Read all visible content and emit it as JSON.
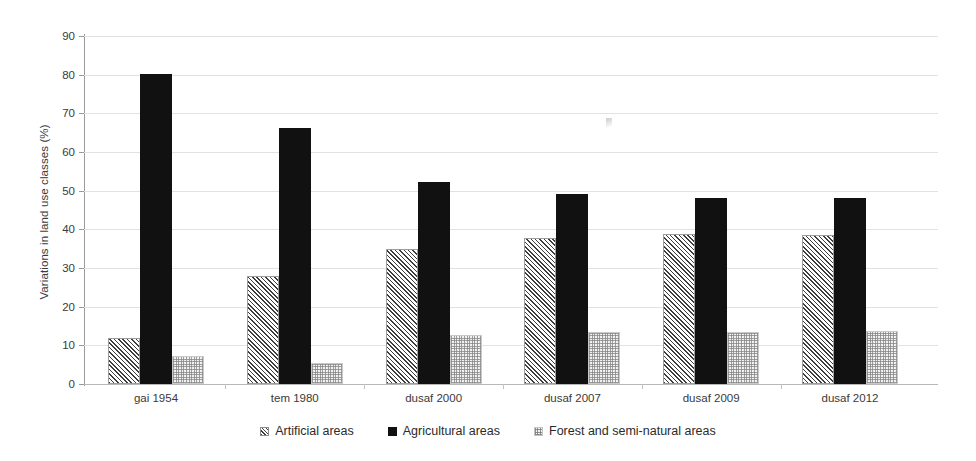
{
  "chart_data": {
    "type": "bar",
    "title": "",
    "subtitle": "",
    "xlabel": "",
    "ylabel": "Variations in land use classes (%)",
    "ylim": [
      0,
      90
    ],
    "ytick_step": 10,
    "yticks": [
      0,
      10,
      20,
      30,
      40,
      50,
      60,
      70,
      80,
      90
    ],
    "ytick_labels": [
      "0",
      "10",
      "20",
      "30",
      "40",
      "50",
      "60",
      "70",
      "80",
      "90"
    ],
    "grid": true,
    "grid_axis": "y",
    "legend_position": "bottom-center",
    "categories": [
      "gai 1954",
      "tem 1980",
      "dusaf 2000",
      "dusaf 2007",
      "dusaf 2009",
      "dusaf 2012"
    ],
    "series": [
      {
        "name": "Artificial areas",
        "pattern": "diagonal-hatch",
        "color": "#3d3d3d",
        "values": [
          11.8,
          28.0,
          34.8,
          37.8,
          38.7,
          38.5
        ]
      },
      {
        "name": "Agricultural areas",
        "pattern": "solid",
        "color": "#111111",
        "values": [
          80.2,
          66.1,
          52.2,
          49.1,
          48.0,
          48.0
        ]
      },
      {
        "name": "Forest and semi-natural areas",
        "pattern": "stipple-dotted",
        "color": "#b6b6b6",
        "values": [
          7.2,
          5.5,
          12.6,
          13.4,
          13.4,
          13.7
        ]
      }
    ]
  },
  "legend": {
    "items": [
      {
        "label": "Artificial areas",
        "swatch": "hatched-square-icon"
      },
      {
        "label": "Agricultural areas",
        "swatch": "filled-square-icon"
      },
      {
        "label": "Forest and semi-natural areas",
        "swatch": "dotted-square-icon"
      }
    ]
  },
  "colors": {
    "background": "#ffffff",
    "gridline": "#e2e2e2",
    "axis": "#9a9a9a",
    "text": "#3a3a3a"
  }
}
